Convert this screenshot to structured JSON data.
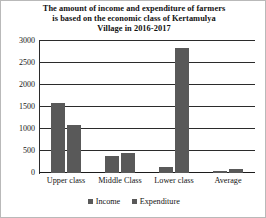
{
  "chart_data": {
    "type": "bar",
    "title": "The amount of income and expenditure of farmers is based on the economic class of Kertamulya Village in 2016-2017",
    "title_lines": [
      "The amount of income and expenditure of farmers",
      "is based on the economic class of Kertamulya",
      "Village in 2016-2017"
    ],
    "categories": [
      "Upper class",
      "Middle Class",
      "Lower class",
      "Average"
    ],
    "series": [
      {
        "name": "Income",
        "values": [
          1580,
          390,
          130,
          50
        ]
      },
      {
        "name": "Expenditure",
        "values": [
          1090,
          450,
          2840,
          95
        ]
      }
    ],
    "xlabel": "",
    "ylabel": "",
    "ylim": [
      0,
      3000
    ],
    "ytick_values": [
      0,
      500,
      1000,
      1500,
      2000,
      2500,
      3000
    ],
    "ytick_labels": [
      "0",
      "500",
      "1000",
      "1500",
      "2000",
      "2500",
      "3000"
    ],
    "grid": true,
    "legend_position": "bottom",
    "bar_color": "#595959",
    "gridline_color": "#2b2b2b"
  }
}
